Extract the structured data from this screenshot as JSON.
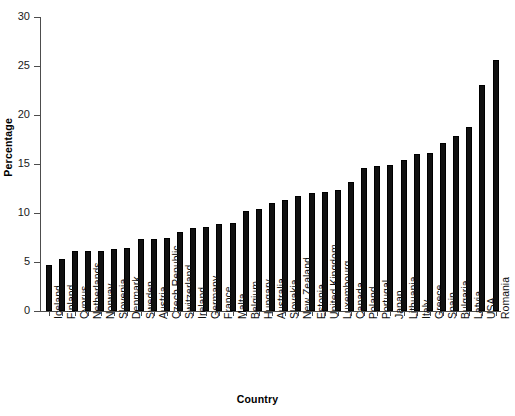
{
  "chart_data": {
    "type": "bar",
    "title": "",
    "xlabel": "Country",
    "ylabel": "Percentage",
    "ylim": [
      0,
      30
    ],
    "yticks": [
      0,
      5,
      10,
      15,
      20,
      25,
      30
    ],
    "grid": false,
    "legend": null,
    "bar_color": "#111111",
    "axis_color": "#4d4d4d",
    "categories": [
      "Iceland",
      "Finland",
      "Cyprus",
      "Netherlands",
      "Norway",
      "Slovenia",
      "Denmark",
      "Sweden",
      "Austria",
      "Czech Republic",
      "Switzerland",
      "Ireland",
      "Germany",
      "France",
      "Malta",
      "Belgium",
      "Hungary",
      "Australia",
      "Slovakia",
      "New Zealand",
      "Estonia",
      "United Kingdom",
      "Luxembourg",
      "Canada",
      "Poland",
      "Portugal",
      "Japan",
      "Lithuania",
      "Italy",
      "Greece",
      "Spain",
      "Bulgaria",
      "Latvia",
      "USA",
      "Romania"
    ],
    "values": [
      4.7,
      5.3,
      6.1,
      6.1,
      6.1,
      6.3,
      6.4,
      7.3,
      7.3,
      7.4,
      8.1,
      8.5,
      8.6,
      8.9,
      9.0,
      10.2,
      10.4,
      11.0,
      11.3,
      11.7,
      12.0,
      12.1,
      12.3,
      13.2,
      14.6,
      14.8,
      14.9,
      15.4,
      16.0,
      16.1,
      17.1,
      17.9,
      18.8,
      23.1,
      25.6
    ]
  }
}
